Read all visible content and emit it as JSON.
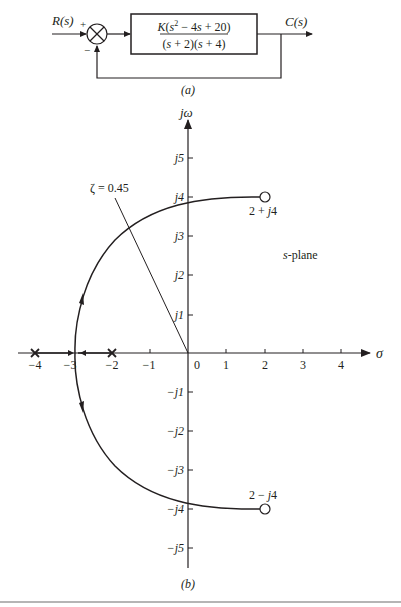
{
  "block_diagram": {
    "input_label": "R(s)",
    "output_label": "C(s)",
    "summing_plus": "+",
    "summing_minus": "−",
    "transfer_function": {
      "numerator": "K(s² − 4s + 20)",
      "numerator_parts": {
        "pre": "K(s",
        "sup": "2",
        "post": " − 4s + 20)"
      },
      "denominator": "(s + 2)(s + 4)"
    },
    "caption": "(a)"
  },
  "root_locus": {
    "caption": "(b)",
    "x_axis_label": "σ",
    "y_axis_label": "jω",
    "plane_label": "s-plane",
    "zeta_label": "ζ = 0.45",
    "x_ticks": [
      "−4",
      "−3",
      "−2",
      "−1",
      "0",
      "1",
      "2",
      "3",
      "4"
    ],
    "y_ticks_pos": [
      "j1",
      "j2",
      "j3",
      "j4",
      "j5"
    ],
    "y_ticks_neg": [
      "−j1",
      "−j2",
      "−j3",
      "−j4",
      "−j5"
    ],
    "poles": [
      {
        "re": -4,
        "im": 0
      },
      {
        "re": -2,
        "im": 0
      }
    ],
    "zeros": [
      {
        "re": 2,
        "im": 4,
        "label": "2 + j4"
      },
      {
        "re": 2,
        "im": -4,
        "label": "2 − j4"
      }
    ],
    "breakin_point": -2.9,
    "jw_crossing": 3.7,
    "zeta": 0.45,
    "line_color": "#231f20"
  }
}
